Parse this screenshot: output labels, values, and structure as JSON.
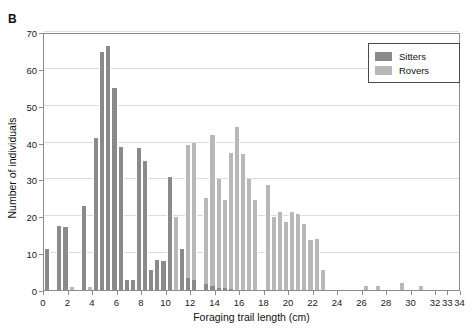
{
  "panel": {
    "label": "B"
  },
  "legend": {
    "position": "top-right",
    "entries": [
      {
        "name": "Sitters",
        "color": "#8a8a8a"
      },
      {
        "name": "Rovers",
        "color": "#b8b8b8"
      }
    ]
  },
  "chart_data": {
    "type": "bar",
    "subtype": "histogram-stacked",
    "title": "",
    "xlabel": "Foraging trail length (cm)",
    "ylabel": "Number of individuals",
    "xlim": [
      0,
      34
    ],
    "ylim": [
      0,
      70
    ],
    "ytick_values": [
      0,
      10,
      20,
      30,
      40,
      50,
      60,
      70
    ],
    "ytick_labels": [
      "0",
      "10",
      "20",
      "30",
      "40",
      "50",
      "60",
      "70"
    ],
    "xtick_values": [
      0,
      2,
      4,
      6,
      8,
      10,
      12,
      14,
      16,
      18,
      20,
      22,
      24,
      26,
      28,
      30,
      32,
      33,
      34
    ],
    "xtick_labels": [
      "0",
      "2",
      "4",
      "6",
      "8",
      "10",
      "12",
      "14",
      "16",
      "18",
      "20",
      "22",
      "24",
      "26",
      "28",
      "30",
      "32",
      "33",
      "34"
    ],
    "grid": "horizontal",
    "bin_width": 0.5,
    "legend_position": "top-right",
    "bin_starts": [
      0,
      0.5,
      1,
      1.5,
      2,
      2.5,
      3,
      3.5,
      4,
      4.5,
      5,
      5.5,
      6,
      6.5,
      7,
      7.5,
      8,
      8.5,
      9,
      9.5,
      10,
      10.5,
      11,
      11.5,
      12,
      12.5,
      13,
      13.5,
      14,
      14.5,
      15,
      15.5,
      16,
      16.5,
      17,
      17.5,
      18,
      18.5,
      19,
      19.5,
      20,
      20.5,
      21,
      21.5,
      22,
      22.5,
      23,
      23.5,
      24,
      24.5,
      25,
      25.5,
      26,
      27.5,
      28,
      29.5,
      31,
      32.5
    ],
    "series": [
      {
        "name": "Sitters",
        "color": "#8a8a8a",
        "values": [
          11,
          0,
          17.5,
          17,
          0.8,
          0.8,
          22.7,
          0.8,
          41.3,
          64.5,
          66.3,
          54.7,
          38.8,
          2.8,
          2.8,
          38.5,
          35,
          5.3,
          8.2,
          8,
          30.7,
          0,
          11.2,
          3.2,
          2.6,
          1.5,
          1,
          0.6,
          0.5,
          0.4,
          0,
          0,
          0,
          0,
          0,
          0,
          0,
          0,
          0,
          0,
          0,
          0,
          0,
          0,
          0,
          0,
          0,
          0,
          0,
          0,
          0,
          0,
          0,
          0,
          0,
          0,
          0,
          0
        ]
      },
      {
        "name": "Rovers",
        "color": "#b8b8b8",
        "values": [
          0,
          0,
          0,
          0.8,
          0.8,
          0,
          0,
          0.8,
          0,
          0,
          0,
          0,
          0,
          0,
          0,
          0,
          0,
          0,
          0,
          0,
          19.7,
          39.3,
          39.8,
          0,
          25,
          42,
          30,
          24.5,
          37.2,
          44.2,
          37,
          30,
          24.5,
          28.6,
          19.7,
          21.3,
          18.5,
          21.1,
          20.5,
          17.8,
          13.6,
          13.8,
          5.3,
          0,
          1.2,
          1.1,
          1.8,
          1.1,
          0,
          0,
          0,
          0,
          0,
          0,
          0,
          0,
          0,
          0
        ]
      }
    ],
    "bars": [
      {
        "x": 0,
        "sitters": 11,
        "rovers": 0
      },
      {
        "x": 1,
        "sitters": 17.5,
        "rovers": 0
      },
      {
        "x": 1.5,
        "sitters": 17,
        "rovers": 0.8
      },
      {
        "x": 2,
        "sitters": 0,
        "rovers": 0.8
      },
      {
        "x": 3,
        "sitters": 22.7,
        "rovers": 0
      },
      {
        "x": 3.5,
        "sitters": 0,
        "rovers": 0.8
      },
      {
        "x": 4,
        "sitters": 41.3,
        "rovers": 0
      },
      {
        "x": 4.5,
        "sitters": 64.5,
        "rovers": 0
      },
      {
        "x": 5,
        "sitters": 66.3,
        "rovers": 0
      },
      {
        "x": 5.5,
        "sitters": 54.7,
        "rovers": 0
      },
      {
        "x": 6,
        "sitters": 38.8,
        "rovers": 0
      },
      {
        "x": 6.5,
        "sitters": 2.8,
        "rovers": 0
      },
      {
        "x": 7,
        "sitters": 2.8,
        "rovers": 0
      },
      {
        "x": 7.5,
        "sitters": 38.5,
        "rovers": 0
      },
      {
        "x": 8,
        "sitters": 35,
        "rovers": 0
      },
      {
        "x": 8.5,
        "sitters": 5.3,
        "rovers": 0
      },
      {
        "x": 9,
        "sitters": 8.2,
        "rovers": 0
      },
      {
        "x": 9.5,
        "sitters": 8,
        "rovers": 0
      },
      {
        "x": 10,
        "sitters": 30.7,
        "rovers": 0
      },
      {
        "x": 10.5,
        "sitters": 0,
        "rovers": 19.7
      },
      {
        "x": 11,
        "sitters": 11.2,
        "rovers": 0
      },
      {
        "x": 11.5,
        "sitters": 3.2,
        "rovers": 39.3
      },
      {
        "x": 12,
        "sitters": 2.6,
        "rovers": 39.8
      },
      {
        "x": 13,
        "sitters": 1.5,
        "rovers": 25
      },
      {
        "x": 13.5,
        "sitters": 1,
        "rovers": 42
      },
      {
        "x": 14,
        "sitters": 0.6,
        "rovers": 30
      },
      {
        "x": 14.5,
        "sitters": 0.5,
        "rovers": 24.5
      },
      {
        "x": 15,
        "sitters": 0.4,
        "rovers": 37.2
      },
      {
        "x": 15.5,
        "sitters": 0,
        "rovers": 44.2
      },
      {
        "x": 16,
        "sitters": 0,
        "rovers": 37
      },
      {
        "x": 16.5,
        "sitters": 0,
        "rovers": 30
      },
      {
        "x": 17,
        "sitters": 0,
        "rovers": 24.5
      },
      {
        "x": 18,
        "sitters": 0,
        "rovers": 28.6
      },
      {
        "x": 18.5,
        "sitters": 0,
        "rovers": 19.7
      },
      {
        "x": 19,
        "sitters": 0,
        "rovers": 21.3
      },
      {
        "x": 19.5,
        "sitters": 0,
        "rovers": 18.5
      },
      {
        "x": 20,
        "sitters": 0,
        "rovers": 21.1
      },
      {
        "x": 20.5,
        "sitters": 0,
        "rovers": 20.5
      },
      {
        "x": 21,
        "sitters": 0,
        "rovers": 17.8
      },
      {
        "x": 21.5,
        "sitters": 0,
        "rovers": 13.6
      },
      {
        "x": 22,
        "sitters": 0,
        "rovers": 13.8
      },
      {
        "x": 22.5,
        "sitters": 0,
        "rovers": 5.3
      },
      {
        "x": 26,
        "sitters": 0,
        "rovers": 1.2
      },
      {
        "x": 27,
        "sitters": 0,
        "rovers": 1.1
      },
      {
        "x": 29,
        "sitters": 0,
        "rovers": 1.8
      },
      {
        "x": 30.5,
        "sitters": 0,
        "rovers": 1.1
      }
    ]
  }
}
